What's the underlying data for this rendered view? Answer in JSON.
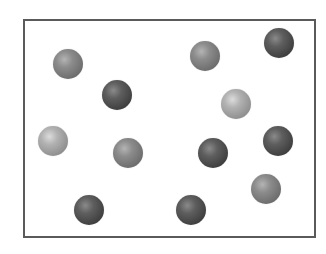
{
  "diagram": {
    "frame": {
      "left": 23,
      "top": 19,
      "right": 314,
      "bottom": 236,
      "border_color": "#5a5a5a"
    },
    "colors": {
      "dark": "#3e3e3e",
      "medium": "#6c6c6c",
      "light": "#8e8e8e"
    },
    "particles": [
      {
        "id": 1,
        "cx": 68,
        "cy": 64,
        "r": 15,
        "shade": "medium"
      },
      {
        "id": 2,
        "cx": 117,
        "cy": 95,
        "r": 15,
        "shade": "dark"
      },
      {
        "id": 3,
        "cx": 205,
        "cy": 56,
        "r": 15,
        "shade": "medium"
      },
      {
        "id": 4,
        "cx": 279,
        "cy": 43,
        "r": 15,
        "shade": "dark"
      },
      {
        "id": 5,
        "cx": 236,
        "cy": 104,
        "r": 15,
        "shade": "light"
      },
      {
        "id": 6,
        "cx": 53,
        "cy": 141,
        "r": 15,
        "shade": "light"
      },
      {
        "id": 7,
        "cx": 128,
        "cy": 153,
        "r": 15,
        "shade": "medium"
      },
      {
        "id": 8,
        "cx": 213,
        "cy": 153,
        "r": 15,
        "shade": "dark"
      },
      {
        "id": 9,
        "cx": 278,
        "cy": 141,
        "r": 15,
        "shade": "dark"
      },
      {
        "id": 10,
        "cx": 266,
        "cy": 189,
        "r": 15,
        "shade": "medium"
      },
      {
        "id": 11,
        "cx": 89,
        "cy": 210,
        "r": 15,
        "shade": "dark"
      },
      {
        "id": 12,
        "cx": 191,
        "cy": 210,
        "r": 15,
        "shade": "dark"
      }
    ]
  }
}
